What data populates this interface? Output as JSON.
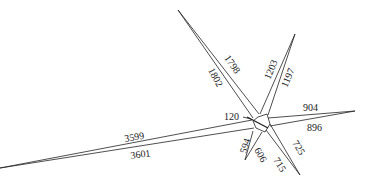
{
  "diagram": {
    "type": "road-junction-plan",
    "center_label": "120",
    "arms": [
      {
        "name": "northwest",
        "label_left": "1802",
        "label_right": "1798"
      },
      {
        "name": "northeast",
        "label_left": "1203",
        "label_right": "1197"
      },
      {
        "name": "east",
        "label_top": "904",
        "label_bottom": "896"
      },
      {
        "name": "southeast",
        "label_left": "715",
        "label_right": "725"
      },
      {
        "name": "south",
        "label_left": "594",
        "label_right": "606"
      },
      {
        "name": "west",
        "label_top": "3599",
        "label_bottom": "3601"
      }
    ]
  }
}
